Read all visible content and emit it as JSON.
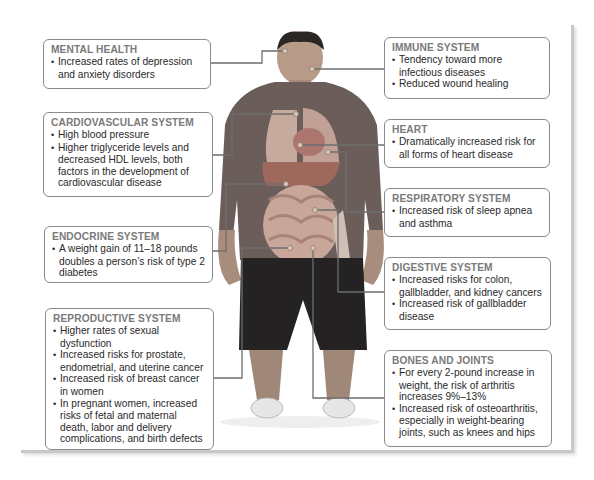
{
  "left_boxes": [
    {
      "title": "MENTAL HEALTH",
      "bullets": [
        "Increased rates of depression and anxiety disorders"
      ]
    },
    {
      "title": "CARDIOVASCULAR SYSTEM",
      "bullets": [
        "High blood pressure",
        "Higher triglyceride levels and decreased HDL levels,  both factors in the development of cardiovascular disease"
      ]
    },
    {
      "title": "ENDOCRINE SYSTEM",
      "bullets": [
        "A weight gain of 11–18 pounds doubles a person’s risk of type 2 diabetes"
      ]
    },
    {
      "title": "REPRODUCTIVE SYSTEM",
      "bullets": [
        "Higher rates of sexual dysfunction",
        "Increased risks for prostate, endometrial, and uterine cancer",
        "Increased risk of breast cancer in women",
        "In pregnant women,  increased risks of fetal and maternal death, labor and delivery complications, and birth defects"
      ]
    }
  ],
  "right_boxes": [
    {
      "title": "IMMUNE SYSTEM",
      "bullets": [
        "Tendency toward more infectious diseases",
        "Reduced wound healing"
      ]
    },
    {
      "title": "HEART",
      "bullets": [
        "Dramatically increased risk for all forms of heart disease"
      ]
    },
    {
      "title": "RESPIRATORY SYSTEM",
      "bullets": [
        "Increased risk of sleep apnea and asthma"
      ]
    },
    {
      "title": "DIGESTIVE SYSTEM",
      "bullets": [
        "Increased risks for colon, gallbladder,  and kidney cancers",
        "Increased risk of gallbladder disease"
      ]
    },
    {
      "title": "BONES AND JOINTS",
      "bullets": [
        "For every 2-pound increase in weight,  the risk of arthritis increases 9%–13%",
        "Increased risk of osteoarthritis, especially in weight-bearing joints, such as knees and hips"
      ]
    }
  ]
}
